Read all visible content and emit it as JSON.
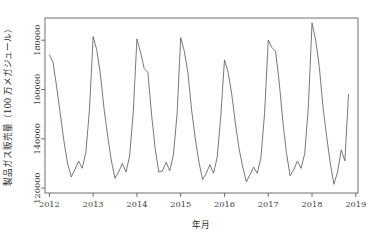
{
  "chart_data": {
    "type": "line",
    "title": "",
    "subtitle": "",
    "xlabel": "年月",
    "ylabel": "製品ガス販売量（100 万メガジュール）",
    "grid": false,
    "legend": null,
    "legend_position": "none",
    "xlim": [
      2011.9,
      2019.05
    ],
    "ylim": [
      118000,
      189000
    ],
    "xtick_labels": [
      "2012",
      "2013",
      "2014",
      "2015",
      "2016",
      "2017",
      "2018",
      "2019"
    ],
    "xticks": [
      2012,
      2013,
      2014,
      2015,
      2016,
      2017,
      2018,
      2019
    ],
    "ytick_labels": [
      "120000",
      "140000",
      "160000",
      "180000"
    ],
    "yticks": [
      120000,
      140000,
      160000,
      180000
    ],
    "x_unit": "year-month (decimal year)",
    "series": [
      {
        "name": "製品ガス販売量",
        "color": "#555555",
        "x": [
          2012.0,
          2012.0833,
          2012.1667,
          2012.25,
          2012.3333,
          2012.4167,
          2012.5,
          2012.5833,
          2012.6667,
          2012.75,
          2012.8333,
          2012.9167,
          2013.0,
          2013.0833,
          2013.1667,
          2013.25,
          2013.3333,
          2013.4167,
          2013.5,
          2013.5833,
          2013.6667,
          2013.75,
          2013.8333,
          2013.9167,
          2014.0,
          2014.0833,
          2014.1667,
          2014.25,
          2014.3333,
          2014.4167,
          2014.5,
          2014.5833,
          2014.6667,
          2014.75,
          2014.8333,
          2014.9167,
          2015.0,
          2015.0833,
          2015.1667,
          2015.25,
          2015.3333,
          2015.4167,
          2015.5,
          2015.5833,
          2015.6667,
          2015.75,
          2015.8333,
          2015.9167,
          2016.0,
          2016.0833,
          2016.1667,
          2016.25,
          2016.3333,
          2016.4167,
          2016.5,
          2016.5833,
          2016.6667,
          2016.75,
          2016.8333,
          2016.9167,
          2017.0,
          2017.0833,
          2017.1667,
          2017.25,
          2017.3333,
          2017.4167,
          2017.5,
          2017.5833,
          2017.6667,
          2017.75,
          2017.8333,
          2017.9167,
          2018.0,
          2018.0833,
          2018.1667,
          2018.25,
          2018.3333,
          2018.4167,
          2018.5,
          2018.5833,
          2018.6667,
          2018.75,
          2018.8333
        ],
        "values": [
          174000,
          171000,
          161000,
          150000,
          139000,
          130000,
          124500,
          127500,
          131000,
          128000,
          134500,
          152000,
          181500,
          176000,
          166000,
          152000,
          141000,
          131000,
          124000,
          126500,
          130000,
          126500,
          133000,
          151000,
          180500,
          175000,
          168500,
          167000,
          150000,
          136000,
          126500,
          127000,
          130500,
          127000,
          133500,
          150000,
          181000,
          175500,
          166500,
          151500,
          140000,
          130500,
          123500,
          126000,
          129500,
          126000,
          132500,
          149500,
          172000,
          167000,
          158000,
          146000,
          136000,
          128500,
          122500,
          125500,
          128500,
          126000,
          132500,
          150500,
          180000,
          177000,
          175500,
          163000,
          147000,
          134000,
          125000,
          127500,
          131000,
          128000,
          134000,
          153000,
          187000,
          180000,
          169000,
          153000,
          141000,
          130000,
          121500,
          126500,
          135500,
          131000,
          158000
        ]
      }
    ],
    "notes": {
      "pattern": "Strong annual seasonality: January peaks, July–August troughs with a small secondary summer bump.",
      "max_point": {
        "x": 2018.0,
        "value": 187000,
        "label": "2018-01"
      },
      "min_point": {
        "x": 2018.5,
        "value": 121500,
        "label": "2018-07"
      },
      "series_end": {
        "x": 2018.8333,
        "value": 158000,
        "label": "2018-11"
      }
    }
  },
  "plot_geometry": {
    "left": 45,
    "right": 358,
    "top": 18,
    "bottom": 193
  }
}
